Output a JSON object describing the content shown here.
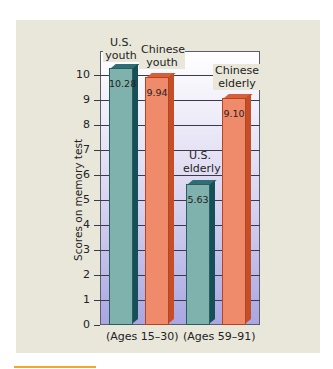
{
  "chart_data": {
    "type": "bar",
    "title": "",
    "xlabel": "",
    "ylabel": "Scores on memory test",
    "ylim": [
      0,
      10.5
    ],
    "yticks": [
      0,
      1,
      2,
      3,
      4,
      5,
      6,
      7,
      8,
      9,
      10
    ],
    "grid": true,
    "categories": [
      "U.S. youth",
      "Chinese youth",
      "U.S. elderly",
      "Chinese elderly"
    ],
    "values": [
      10.28,
      9.94,
      5.63,
      9.1
    ],
    "value_labels": [
      "10.28",
      "9.94",
      "5.63",
      "9.10"
    ],
    "groups": [
      {
        "label": "(Ages 15–30)",
        "members": [
          "U.S. youth",
          "Chinese youth"
        ]
      },
      {
        "label": "(Ages 59–91)",
        "members": [
          "U.S. elderly",
          "Chinese elderly"
        ]
      }
    ],
    "series_colors": {
      "U.S.": "#7fb2ac",
      "Chinese": "#ef8a6a"
    }
  },
  "labels": {
    "us_youth_l1": "U.S.",
    "us_youth_l2": "youth",
    "cn_youth_l1": "Chinese",
    "cn_youth_l2": "youth",
    "us_elderly_l1": "U.S.",
    "us_elderly_l2": "elderly",
    "cn_elderly_l1": "Chinese",
    "cn_elderly_l2": "elderly"
  },
  "colors": {
    "panel": "#e8e7da",
    "accent_rule": "#f2a928"
  }
}
